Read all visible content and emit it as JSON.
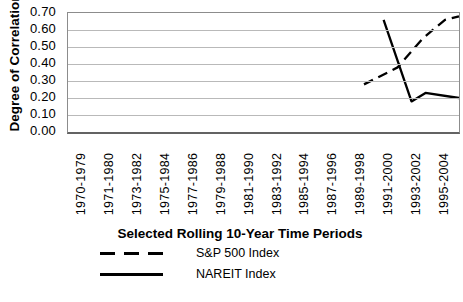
{
  "chart_data": {
    "type": "line",
    "title": "",
    "xlabel": "Selected Rolling 10-Year Time Periods",
    "ylabel": "Degree of Correlation",
    "categories": [
      "1970-1979",
      "1971-1980",
      "1973-1982",
      "1975-1984",
      "1977-1986",
      "1979-1988",
      "1981-1990",
      "1983-1992",
      "1985-1994",
      "1987-1996",
      "1989-1998",
      "1991-2000",
      "1993-2002",
      "1995-2004"
    ],
    "ylim": [
      0,
      0.7
    ],
    "ytick_step": 0.1,
    "ytick_labels": [
      "0.70",
      "0.60",
      "0.50",
      "0.40",
      "0.30",
      "0.20",
      "0.10",
      "0.00"
    ],
    "grid": true,
    "legend_position": "bottom-left",
    "x_note": "series x values are fractional positions along the 14-slot category axis (category i is centered at x=i); data exists only for the late periods 1989-1998 through 1995-2004",
    "series": [
      {
        "name": "S&P 500 Index",
        "line_style": "dashed",
        "color": "#000000",
        "points": [
          {
            "x": 10.1,
            "y": 0.28
          },
          {
            "x": 11.3,
            "y": 0.38
          },
          {
            "x": 12.2,
            "y": 0.55
          },
          {
            "x": 13.0,
            "y": 0.66
          },
          {
            "x": 13.5,
            "y": 0.68
          }
        ]
      },
      {
        "name": "NAREIT Index",
        "line_style": "solid",
        "color": "#000000",
        "points": [
          {
            "x": 10.8,
            "y": 0.66
          },
          {
            "x": 11.8,
            "y": 0.18
          },
          {
            "x": 12.3,
            "y": 0.23
          },
          {
            "x": 13.5,
            "y": 0.2
          }
        ]
      }
    ]
  },
  "legend": {
    "items": [
      {
        "label": "S&P 500 Index",
        "line_style": "dashed"
      },
      {
        "label": "NAREIT Index",
        "line_style": "solid"
      }
    ]
  },
  "colors": {
    "line": "#000000",
    "grid": "#b9b9b9",
    "plot_border": "#8c8c8c",
    "text": "#000000",
    "background": "#ffffff"
  }
}
